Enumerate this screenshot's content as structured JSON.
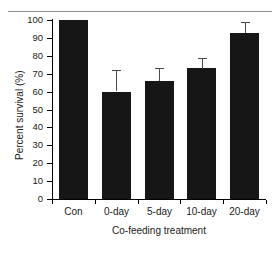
{
  "chart_data": {
    "type": "bar",
    "title": "",
    "subtitle": "",
    "xlabel": "Co-feeding treatment",
    "ylabel": "Percent survival (%)",
    "categories": [
      "Con",
      "0-day",
      "5-day",
      "10-day",
      "20-day"
    ],
    "values": [
      100,
      60,
      66,
      73,
      93
    ],
    "error_upper": [
      0,
      12,
      7,
      6,
      6
    ],
    "ylim": [
      0,
      100
    ],
    "yticks": [
      0,
      10,
      20,
      30,
      40,
      50,
      60,
      70,
      80,
      90,
      100
    ],
    "ytick_labels": [
      "0",
      "10",
      "20",
      "30",
      "40",
      "50",
      "60",
      "70",
      "80",
      "90",
      "100"
    ],
    "grid": false,
    "legend": false,
    "legend_position": "none",
    "bar_color": "#161616",
    "error_color": "#4a4a4a",
    "axis_color": "#000000",
    "background_color": "#ffffff",
    "top_rule_color": "#8d8d8d"
  }
}
